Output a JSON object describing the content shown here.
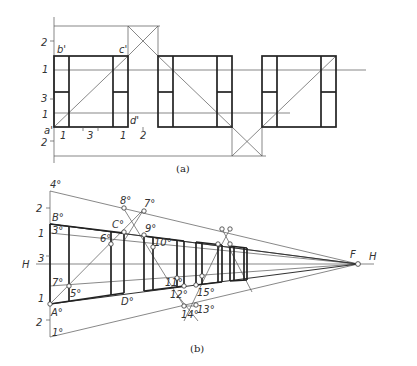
{
  "figure_a": {
    "caption": "(a)",
    "labels": {
      "b": "b'",
      "c": "c'",
      "a": "a'",
      "d": "d'"
    },
    "left_ticks": [
      "2",
      "1",
      "3",
      "1",
      "2"
    ],
    "bottom_ticks": [
      "1",
      "3",
      "1",
      "2"
    ]
  },
  "figure_b": {
    "caption": "(b)",
    "horizon_left": "H",
    "horizon_right": "H",
    "vanishing_point": "F",
    "left_ticks": [
      "2",
      "1",
      "3",
      "1",
      "2"
    ],
    "points": {
      "p4": "4°",
      "B": "B°",
      "p3": "3°",
      "p7": "7°",
      "A": "A°",
      "p1": "1°",
      "p5": "5°",
      "p6": "6°",
      "C": "C°",
      "D": "D°",
      "p8": "8°",
      "p7b": "7°",
      "p9": "9°",
      "p10": "10°",
      "p11": "11°",
      "p12": "12°",
      "p13": "13°",
      "p14": "14°",
      "p15": "15°"
    }
  },
  "colors": {
    "line": "#222222",
    "thin": "#555555",
    "background": "#ffffff"
  }
}
